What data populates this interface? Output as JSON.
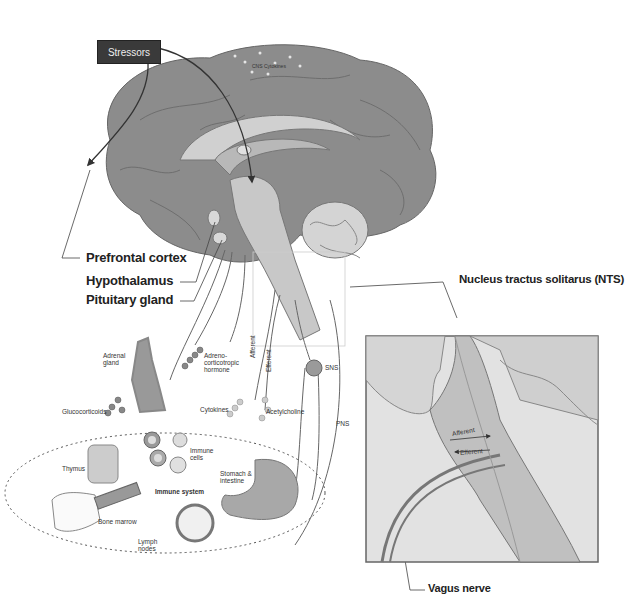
{
  "figure": {
    "stressors_label": "Stressors",
    "brain_labels": {
      "cns_cytokines": "CNS Cytokines",
      "prefrontal_cortex": "Prefrontal cortex",
      "hypothalamus": "Hypothalamus",
      "pituitary_gland": "Pituitary gland",
      "nts": "Nucleus tractus solitarus (NTS)"
    },
    "periphery_labels": {
      "adrenal_gland": "Adrenal gland",
      "acth": "Adreno-corticotropic hormone",
      "glucocorticoids": "Glucocorticoids",
      "afferent": "Afferent",
      "efferent": "Efferent",
      "cytokines": "Cytokines",
      "acetylcholine": "Acetylcholine",
      "sns": "SNS",
      "pns": "PNS"
    },
    "immune_system": {
      "title": "Immune system",
      "thymus": "Thymus",
      "immune_cells": "Immune cells",
      "bone_marrow": "Bone marrow",
      "stomach_intestine": "Stomach & intestine",
      "lymph_nodes": "Lymph nodes"
    },
    "inset": {
      "afferent": "Afferent",
      "efferent": "Efferent",
      "vagus_nerve": "Vagus nerve"
    },
    "colors": {
      "cortex": "#8c8c8c",
      "inner": "#b8b8b8",
      "light": "#d8d8d8",
      "inset_bg": "#e2e2e2",
      "stressor_box": "#3a3a3a"
    }
  }
}
